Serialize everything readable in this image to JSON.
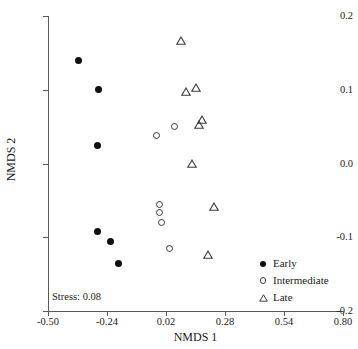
{
  "chart_data": {
    "type": "scatter",
    "title": "",
    "xlabel": "NMDS 1",
    "ylabel": "NMDS 2",
    "xlim": [
      -0.5,
      0.8
    ],
    "ylim": [
      -0.2,
      0.2
    ],
    "xticks": [
      "-0.50",
      "-0.24",
      "0.02",
      "0.28",
      "0.54",
      "0.80"
    ],
    "xtick_values": [
      -0.5,
      -0.24,
      0.02,
      0.28,
      0.54,
      0.8
    ],
    "yticks": [
      "0.2",
      "0.1",
      "0.0",
      "-0.1",
      "-0.2"
    ],
    "ytick_values": [
      0.2,
      0.1,
      0.0,
      -0.1,
      -0.2
    ],
    "grid": false,
    "legend_position": "bottom-right",
    "annotations": [
      {
        "text": "Stress: 0.08",
        "x": -0.47,
        "y": -0.175
      }
    ],
    "series": [
      {
        "name": "Early",
        "marker": "filled-circle",
        "color": "#101010",
        "points": [
          {
            "x": -0.367,
            "y": 0.14
          },
          {
            "x": -0.279,
            "y": 0.1
          },
          {
            "x": -0.283,
            "y": 0.025
          },
          {
            "x": -0.283,
            "y": -0.092
          },
          {
            "x": -0.225,
            "y": -0.106
          },
          {
            "x": -0.19,
            "y": -0.136
          }
        ]
      },
      {
        "name": "Intermediate",
        "marker": "open-circle",
        "color": "#3a3a3a",
        "points": [
          {
            "x": -0.021,
            "y": 0.038
          },
          {
            "x": 0.059,
            "y": 0.05
          },
          {
            "x": -0.01,
            "y": -0.055
          },
          {
            "x": -0.01,
            "y": -0.066
          },
          {
            "x": -0.001,
            "y": -0.08
          },
          {
            "x": 0.036,
            "y": -0.115
          }
        ]
      },
      {
        "name": "Late",
        "marker": "open-triangle",
        "color": "#3a3a3a",
        "points": [
          {
            "x": 0.087,
            "y": 0.167
          },
          {
            "x": 0.108,
            "y": 0.098
          },
          {
            "x": 0.152,
            "y": 0.103
          },
          {
            "x": 0.166,
            "y": 0.053
          },
          {
            "x": 0.18,
            "y": 0.06
          },
          {
            "x": 0.134,
            "y": 0.0
          },
          {
            "x": 0.232,
            "y": -0.058
          },
          {
            "x": 0.207,
            "y": -0.123
          }
        ]
      }
    ]
  },
  "legend": {
    "items": [
      {
        "label": "Early",
        "marker": "filled-circle"
      },
      {
        "label": "Intermediate",
        "marker": "open-circle"
      },
      {
        "label": "Late",
        "marker": "open-triangle"
      }
    ]
  }
}
